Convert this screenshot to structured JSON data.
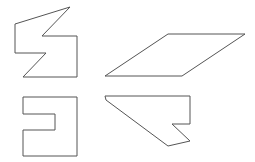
{
  "canvas": {
    "width": 255,
    "height": 162,
    "background": "#ffffff"
  },
  "stroke_color": "#555555",
  "shapes": [
    {
      "name": "s-shaped-polygon",
      "points": "70,7 15,24 15,53 46,53 23,77 77,77 77,36 42,36"
    },
    {
      "name": "parallelogram",
      "points": "168,34 245,34 182,76 105,76"
    },
    {
      "name": "bracket-polygon",
      "points": "23,97 77,97 77,156 23,156 23,130 55,130 55,114 23,114"
    },
    {
      "name": "notched-trapezoid",
      "points": "105,96 190,96 190,124 172,124 190,141 168,146 106,100"
    }
  ]
}
